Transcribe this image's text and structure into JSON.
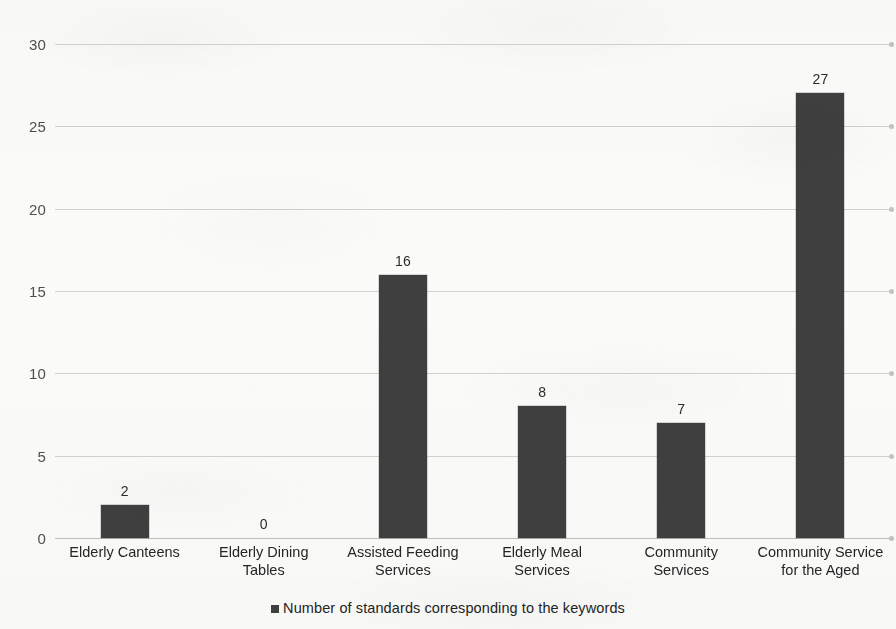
{
  "chart_data": {
    "type": "bar",
    "title": "",
    "xlabel": "",
    "ylabel": "",
    "ylim": [
      0,
      30
    ],
    "yticks": [
      0,
      5,
      10,
      15,
      20,
      25,
      30
    ],
    "grid": true,
    "legend_position": "bottom",
    "categories": [
      "Elderly Canteens",
      "Elderly Dining Tables",
      "Assisted Feeding Services",
      "Elderly Meal Services",
      "Community Services",
      "Community Service for the Aged"
    ],
    "category_lines": [
      [
        "Elderly Canteens"
      ],
      [
        "Elderly Dining",
        "Tables"
      ],
      [
        "Assisted Feeding",
        "Services"
      ],
      [
        "Elderly Meal",
        "Services"
      ],
      [
        "Community",
        "Services"
      ],
      [
        "Community Service",
        "for the Aged"
      ]
    ],
    "series": [
      {
        "name": "Number of standards corresponding to the keywords",
        "values": [
          2,
          0,
          16,
          8,
          7,
          27
        ]
      }
    ],
    "data_labels": [
      "2",
      "0",
      "16",
      "8",
      "7",
      "27"
    ],
    "colors": {
      "bar": "#3f3f3f",
      "gridline": "#c9c9c6",
      "text": "#262626",
      "background": "#fbfbfa"
    }
  },
  "legend": {
    "marker": "square-marker-icon",
    "label": "Number of standards corresponding to the keywords"
  },
  "axis": {
    "y_tick_labels": [
      "30",
      "25",
      "20",
      "15",
      "10",
      "5",
      "0"
    ]
  }
}
